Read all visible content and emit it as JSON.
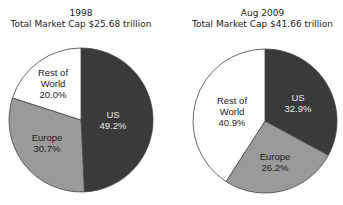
{
  "chart_data": [
    {
      "type": "pie",
      "title": "1998",
      "subtitle": "Total Market Cap $25.68 trillion",
      "slices": [
        {
          "label": "US",
          "value": 49.2,
          "display": "49.2%",
          "color": "#3a3a3a",
          "text_color": "#e6e6e6"
        },
        {
          "label": "Europe",
          "value": 30.7,
          "display": "30.7%",
          "color": "#9a9a9a",
          "text_color": "#222222"
        },
        {
          "label": "Rest of World",
          "value": 20.0,
          "display": "20.0%",
          "color": "#ffffff",
          "text_color": "#222222"
        }
      ]
    },
    {
      "type": "pie",
      "title": "Aug 2009",
      "subtitle": "Total Market Cap $41.66 trillion",
      "slices": [
        {
          "label": "US",
          "value": 32.9,
          "display": "32.9%",
          "color": "#3a3a3a",
          "text_color": "#e6e6e6"
        },
        {
          "label": "Europe",
          "value": 26.2,
          "display": "26.2%",
          "color": "#9a9a9a",
          "text_color": "#222222"
        },
        {
          "label": "Rest of World",
          "value": 40.9,
          "display": "40.9%",
          "color": "#ffffff",
          "text_color": "#222222"
        }
      ]
    }
  ],
  "charts": {
    "left": {
      "title": "1998",
      "subtitle": "Total Market Cap $25.68 trillion"
    },
    "right": {
      "title": "Aug 2009",
      "subtitle": "Total Market Cap $41.66 trillion"
    }
  },
  "labels": {
    "left": {
      "us_name": "US",
      "us_pct": "49.2%",
      "eu_name": "Europe",
      "eu_pct": "30.7%",
      "row_l1": "Rest of",
      "row_l2": "World",
      "row_pct": "20.0%"
    },
    "right": {
      "us_name": "US",
      "us_pct": "32.9%",
      "eu_name": "Europe",
      "eu_pct": "26.2%",
      "row_l1": "Rest of",
      "row_l2": "World",
      "row_pct": "40.9%"
    }
  }
}
